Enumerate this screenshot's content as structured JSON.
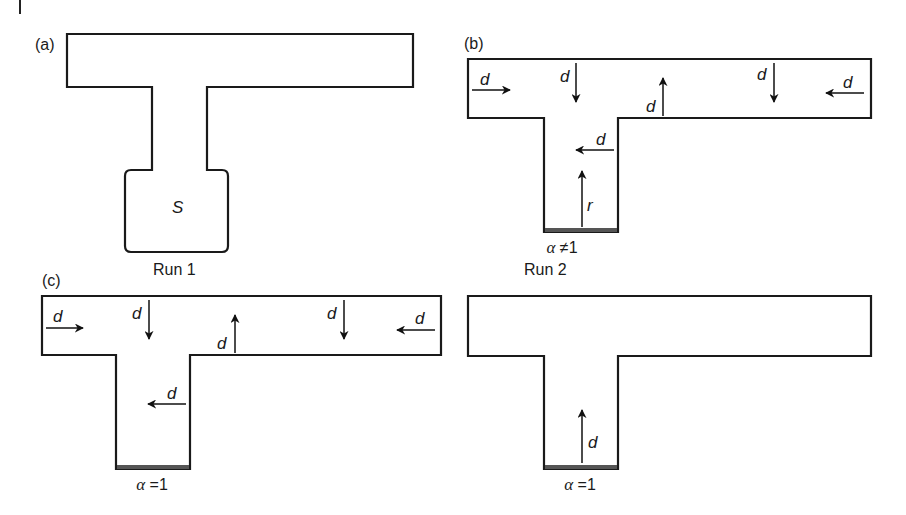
{
  "figure": {
    "panels": [
      {
        "id": "a",
        "label": "(a)",
        "caption": "Run 1",
        "source_label": "S",
        "boundary_label": ""
      },
      {
        "id": "b",
        "label": "(b)",
        "caption": "Run 2",
        "boundary_label": "α ≠1",
        "boundary_alpha": "α",
        "boundary_rest": " ≠1",
        "arrows": [
          {
            "label": "d",
            "direction": "right"
          },
          {
            "label": "d",
            "direction": "down"
          },
          {
            "label": "d",
            "direction": "up"
          },
          {
            "label": "d",
            "direction": "down"
          },
          {
            "label": "d",
            "direction": "left"
          },
          {
            "label": "d",
            "direction": "left"
          },
          {
            "label": "r",
            "direction": "up"
          }
        ]
      },
      {
        "id": "c",
        "label": "(c)",
        "caption": "",
        "boundary_label": "α =1",
        "boundary_alpha": "α",
        "boundary_rest": " =1",
        "arrows": [
          {
            "label": "d",
            "direction": "right"
          },
          {
            "label": "d",
            "direction": "down"
          },
          {
            "label": "d",
            "direction": "up"
          },
          {
            "label": "d",
            "direction": "down"
          },
          {
            "label": "d",
            "direction": "left"
          },
          {
            "label": "d",
            "direction": "left"
          }
        ]
      },
      {
        "id": "d",
        "label": "",
        "caption": "",
        "boundary_label": "α =1",
        "boundary_alpha": "α",
        "boundary_rest": " =1",
        "arrows": [
          {
            "label": "d",
            "direction": "up"
          }
        ]
      }
    ]
  }
}
